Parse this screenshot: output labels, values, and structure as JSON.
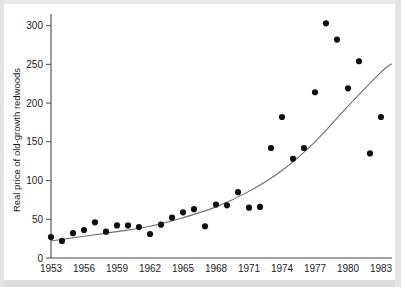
{
  "chart_data": {
    "type": "scatter",
    "title": "",
    "subtitle": "",
    "xlabel": "",
    "ylabel": "Real price of old-growth redwoods",
    "xlim": [
      1953,
      1984
    ],
    "ylim": [
      0,
      315
    ],
    "grid": false,
    "legend": null,
    "x_ticks": [
      1953,
      1956,
      1959,
      1962,
      1965,
      1968,
      1971,
      1974,
      1977,
      1980,
      1983
    ],
    "x_tick_labels": [
      "1953",
      "1956",
      "1959",
      "1962",
      "1965",
      "1968",
      "1971",
      "1974",
      "1977",
      "1980",
      "1983"
    ],
    "y_ticks": [
      0,
      50,
      100,
      150,
      200,
      250,
      300
    ],
    "y_tick_labels": [
      "0",
      "50",
      "100",
      "150",
      "200",
      "250",
      "300"
    ],
    "marker": "filled-circle",
    "marker_color": "#111111",
    "curve_color": "#6e6e6e",
    "series": [
      {
        "name": "Real price of old-growth redwoods",
        "x": [
          1953,
          1954,
          1955,
          1956,
          1957,
          1958,
          1959,
          1960,
          1961,
          1962,
          1963,
          1964,
          1965,
          1966,
          1967,
          1968,
          1969,
          1970,
          1971,
          1972,
          1973,
          1974,
          1975,
          1976,
          1977,
          1978,
          1979,
          1980,
          1981,
          1982,
          1983
        ],
        "y": [
          27,
          22,
          32,
          36,
          46,
          34,
          42,
          42,
          40,
          31,
          43,
          52,
          59,
          63,
          41,
          69,
          68,
          85,
          65,
          66,
          142,
          182,
          128,
          142,
          214,
          303,
          282,
          219,
          254,
          135,
          182
        ]
      }
    ],
    "fit_curve": {
      "name": "exponential trend",
      "x": [
        1953,
        1956,
        1959,
        1962,
        1965,
        1968,
        1971,
        1974,
        1977,
        1980,
        1983,
        1984
      ],
      "y": [
        22,
        28,
        34,
        41,
        52,
        66,
        86,
        113,
        150,
        196,
        240,
        251
      ]
    }
  },
  "axes": {
    "y_axis_label": "Real price of old-growth redwoods"
  }
}
